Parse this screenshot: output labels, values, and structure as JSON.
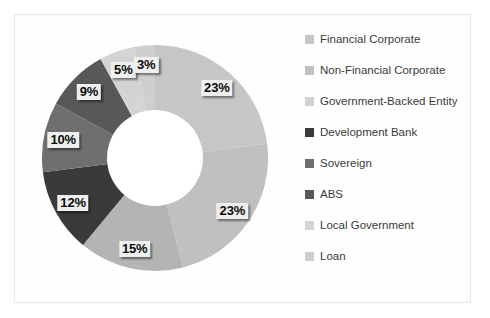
{
  "chart_data": {
    "type": "pie",
    "variant": "donut",
    "title": "",
    "xlabel": "",
    "ylabel": "",
    "legend_position": "right",
    "grid": false,
    "units": "percent",
    "total": 100,
    "start_angle_deg": 0,
    "direction": "clockwise",
    "categories": [
      "Financial Corporate",
      "Non-Financial Corporate",
      "Government-Backed Entity",
      "Development Bank",
      "Sovereign",
      "ABS",
      "Local Government",
      "Loan"
    ],
    "values": [
      23,
      23,
      15,
      12,
      10,
      9,
      5,
      3
    ],
    "data_labels": [
      "23%",
      "23%",
      "15%",
      "12%",
      "10%",
      "9%",
      "5%",
      "3%"
    ],
    "colors": [
      "#c6c6c6",
      "#c0c0c0",
      "#b4b4b4",
      "#3a3a3a",
      "#6f6f6f",
      "#585858",
      "#d4d4d4",
      "#cfcfcf"
    ],
    "slices": [
      {
        "label": "Financial Corporate",
        "value": 23,
        "data_label": "23%",
        "color": "#c6c6c6"
      },
      {
        "label": "Non-Financial Corporate",
        "value": 23,
        "data_label": "23%",
        "color": "#c0c0c0"
      },
      {
        "label": "Government-Backed Entity",
        "value": 15,
        "data_label": "15%",
        "color": "#b4b4b4"
      },
      {
        "label": "Development Bank",
        "value": 12,
        "data_label": "12%",
        "color": "#3a3a3a"
      },
      {
        "label": "Sovereign",
        "value": 10,
        "data_label": "10%",
        "color": "#6f6f6f"
      },
      {
        "label": "ABS",
        "value": 9,
        "data_label": "9%",
        "color": "#585858"
      },
      {
        "label": "Local Government",
        "value": 5,
        "data_label": "5%",
        "color": "#d4d4d4"
      },
      {
        "label": "Loan",
        "value": 3,
        "data_label": "3%",
        "color": "#cfcfcf"
      }
    ]
  },
  "legend": {
    "items": [
      {
        "label": "Financial Corporate",
        "color": "#c6c6c6"
      },
      {
        "label": "Non-Financial Corporate",
        "color": "#c0c0c0"
      },
      {
        "label": "Government-Backed Entity",
        "color": "#d2d2d2"
      },
      {
        "label": "Development Bank",
        "color": "#3a3a3a"
      },
      {
        "label": "Sovereign",
        "color": "#6f6f6f"
      },
      {
        "label": "ABS",
        "color": "#585858"
      },
      {
        "label": "Local Government",
        "color": "#d4d4d4"
      },
      {
        "label": "Loan",
        "color": "#cfcfcf"
      }
    ]
  },
  "style": {
    "background": "#ffffff",
    "frame_color": "#e9e9ea",
    "label_text_color": "#0b0b0b",
    "label_box_color": "#efefef",
    "legend_text_color": "#3b3b3b",
    "donut_hole_color": "#ffffff"
  }
}
